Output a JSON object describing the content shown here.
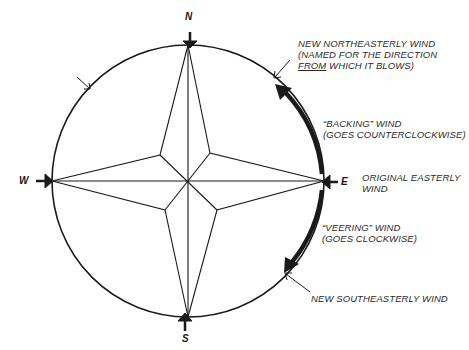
{
  "cardinals": {
    "north": "N",
    "south": "S",
    "east": "E",
    "west": "W"
  },
  "labels": {
    "northeast": {
      "line1": "NEW NORTHEASTERLY WIND",
      "line2": "(NAMED FOR THE DIRECTION",
      "line3_underlined": "FROM",
      "line3_rest": " WHICH IT BLOWS)"
    },
    "backing": {
      "line1": "“BACKING” WIND",
      "line2": "(GOES COUNTERCLOCKWISE)"
    },
    "original": {
      "line1": "ORIGINAL  EASTERLY",
      "line2": "WIND"
    },
    "veering": {
      "line1": "“VEERING” WIND",
      "line2": "(GOES CLOCKWISE)"
    },
    "southeast": {
      "line1": "NEW SOUTHEASTERLY WIND"
    }
  },
  "colors": {
    "ink": "#1a1a1a",
    "background": "#ffffff"
  }
}
